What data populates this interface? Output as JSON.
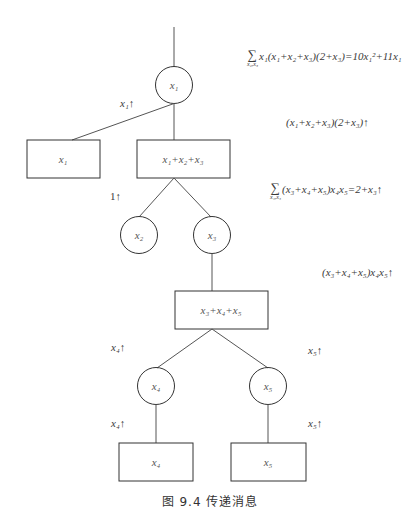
{
  "diagram": {
    "type": "factor-tree-message-passing",
    "nodes": [
      {
        "id": "x1",
        "shape": "circle",
        "label": "x₁"
      },
      {
        "id": "f_x1",
        "shape": "box",
        "label": "x₁"
      },
      {
        "id": "f_x1x2x3",
        "shape": "box",
        "label": "x₁+x₂+x₃"
      },
      {
        "id": "x2",
        "shape": "circle",
        "label": "x₂"
      },
      {
        "id": "x3",
        "shape": "circle",
        "label": "x₃"
      },
      {
        "id": "f_x3x4x5",
        "shape": "box",
        "label": "x₃+x₄+x₅"
      },
      {
        "id": "x4",
        "shape": "circle",
        "label": "x₄"
      },
      {
        "id": "x5",
        "shape": "circle",
        "label": "x₅"
      },
      {
        "id": "f_x4",
        "shape": "box",
        "label": "x₄"
      },
      {
        "id": "f_x5",
        "shape": "box",
        "label": "x₅"
      }
    ],
    "edge_messages": {
      "x1_up_left": "x₁↑",
      "one_up": "1↑",
      "x4_up_upper": "x₄↑",
      "x5_up_upper": "x₅↑",
      "x4_up_lower": "x₄↑",
      "x5_up_lower": "x₅↑"
    },
    "formulas": {
      "f1_sum_sub": "x₂,x₃",
      "f1_body": "x₁(x₁+x₂+x₃)(2+x₃)=10x₁²+11x₁",
      "f2": "(x₁+x₂+x₃)(2+x₃)↑",
      "f3_sum_sub": "x₄,x₅",
      "f3_body": "(x₃+x₄+x₅)x₄x₅=2+x₃↑",
      "f4": "(x₃+x₄+x₅)x₄x₅↑"
    },
    "caption": "图 9.4   传递消息"
  }
}
